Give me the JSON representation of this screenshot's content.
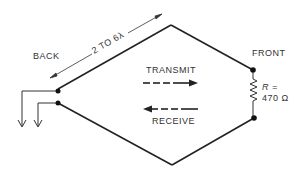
{
  "diagram": {
    "type": "rhombic-antenna",
    "labels": {
      "back": "BACK",
      "front": "FRONT",
      "length": "2 TO 6λ",
      "transmit": "TRANSMIT",
      "receive": "RECEIVE",
      "resistor_r": "R =",
      "resistor_value": "470 Ω"
    },
    "colors": {
      "line": "#222222",
      "text": "#333333",
      "background": "#ffffff"
    }
  }
}
